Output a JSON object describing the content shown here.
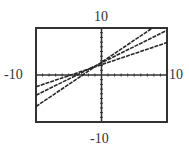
{
  "chart_data": {
    "type": "line",
    "title": "",
    "xlabel": "",
    "ylabel": "",
    "xlim": [
      -10,
      10
    ],
    "ylim": [
      -10,
      10
    ],
    "grid": false,
    "tick_spacing": 1,
    "window_labels": {
      "xmin": "-10",
      "xmax": "10",
      "ymin": "-10",
      "ymax": "10"
    },
    "series": [
      {
        "name": "line-shallow",
        "slope": 0.47,
        "intercept": 2.2
      },
      {
        "name": "line-middle",
        "slope": 0.69,
        "intercept": 2.6
      },
      {
        "name": "line-steep",
        "slope": 0.94,
        "intercept": 2.7
      }
    ],
    "line_color": "#2a2a2a",
    "axis_color": "#333333"
  }
}
